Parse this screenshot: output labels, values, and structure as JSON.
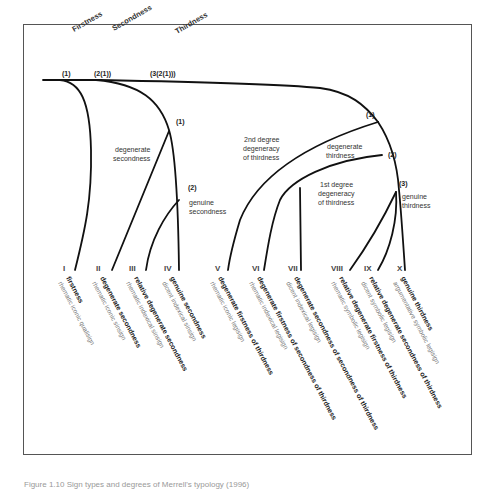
{
  "figure": {
    "categories": [
      {
        "label": "Firstness",
        "x": 74,
        "y": 32
      },
      {
        "label": "Secondness",
        "x": 114,
        "y": 30
      },
      {
        "label": "Thirdness",
        "x": 177,
        "y": 33
      }
    ],
    "trunk_nodes": [
      {
        "label": "(1)",
        "x": 62,
        "y": 44
      },
      {
        "label": "(2(1))",
        "x": 94,
        "y": 44
      },
      {
        "label": "(3(2(1)))",
        "x": 150,
        "y": 44
      }
    ],
    "secondness_nodes": [
      {
        "label": "(1)",
        "x": 175,
        "y": 124
      },
      {
        "label": "(2)",
        "x": 187,
        "y": 190
      }
    ],
    "thirdness_nodes": [
      {
        "label": "(1)",
        "x": 366,
        "y": 120
      },
      {
        "label": "(2)",
        "x": 388,
        "y": 155
      },
      {
        "label": "(3)",
        "x": 399,
        "y": 185
      }
    ],
    "annotations": [
      {
        "id": "degenerate-secondness",
        "lines": [
          "degenerate",
          "secondness"
        ],
        "x": 130,
        "y": 152
      },
      {
        "id": "genuine-secondness",
        "lines": [
          "genuine",
          "secondness"
        ],
        "x": 189,
        "y": 205
      },
      {
        "id": "2nd-degree-degeneracy",
        "lines": [
          "2nd degree",
          "degeneracy",
          "of thirdness"
        ],
        "x": 270,
        "y": 142
      },
      {
        "id": "degenerate-thirdness",
        "lines": [
          "degenerate",
          "thirdness"
        ],
        "x": 347,
        "y": 150
      },
      {
        "id": "1st-degree-degeneracy",
        "lines": [
          "1st degree",
          "degeneracy",
          "of thirdness"
        ],
        "x": 345,
        "y": 186
      },
      {
        "id": "genuine-thirdness",
        "lines": [
          "genuine",
          "thirdness"
        ],
        "x": 402,
        "y": 200
      }
    ],
    "sign_classes": [
      {
        "numeral": "I",
        "name": "firstness",
        "sign": "rhematic iconic qualisign",
        "nx": 65,
        "x": 68
      },
      {
        "numeral": "II",
        "name": "degenerate secondness",
        "sign": "rhematic iconic sinsign",
        "nx": 97,
        "x": 101
      },
      {
        "numeral": "III",
        "name": "relative degenerate secondness",
        "sign": "rhematic indexical sinsign",
        "nx": 130,
        "x": 135
      },
      {
        "numeral": "IV",
        "name": "genuine secondness",
        "sign": "dicent indexical sinsign",
        "nx": 165,
        "x": 170
      },
      {
        "numeral": "V",
        "name": "degenerate firstness of thirdness",
        "sign": "rhematic iconic legisign",
        "nx": 215,
        "x": 218
      },
      {
        "numeral": "VI",
        "name": "degenerate firstness of secondness of thirdness",
        "sign": "rhematic indexical legisign",
        "nx": 252,
        "x": 257
      },
      {
        "numeral": "VII",
        "name": "degenerate secondness of secondness of thirdness",
        "sign": "dicent indexical legisign",
        "nx": 288,
        "x": 294
      },
      {
        "numeral": "VIII",
        "name": "relative degenerate firstness of thirdness",
        "sign": "rhematic symbolic legisign",
        "nx": 332,
        "x": 340
      },
      {
        "numeral": "IX",
        "name": "relative degenerate secondness of thirdness",
        "sign": "dicent symbolic legisign",
        "nx": 364,
        "x": 370
      },
      {
        "numeral": "X",
        "name": "genuine thirdness",
        "sign": "argumentative symbolic legisign",
        "nx": 397,
        "x": 402
      }
    ]
  },
  "caption": "Figure 1.10 Sign types and degrees of Merrell's typology (1996)"
}
